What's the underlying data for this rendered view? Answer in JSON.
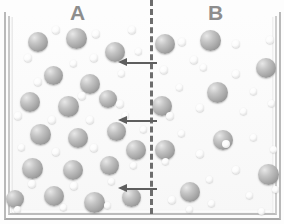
{
  "figure": {
    "title_visible": false,
    "compartments": [
      {
        "id": "A",
        "label": "A",
        "x": 70,
        "y": 2,
        "description": "concentrated solution side"
      },
      {
        "id": "B",
        "label": "B",
        "x": 208,
        "y": 2,
        "description": "dilute solution side"
      }
    ],
    "membrane": {
      "name": "semipermeable-membrane",
      "style": "dashed",
      "x": 150,
      "top": 0,
      "height": 214,
      "color": "#6d6d6d",
      "thickness": 3
    },
    "container": {
      "name": "container",
      "left": 4,
      "top": 12,
      "width": 277,
      "height": 208,
      "border_color": "#b9b9b9",
      "fill_color": "#fdfdfd"
    },
    "arrows": [
      {
        "name": "flow-arrow-top",
        "x": 118,
        "y": 58,
        "length": 39,
        "direction": "left"
      },
      {
        "name": "flow-arrow-middle",
        "x": 118,
        "y": 116,
        "length": 39,
        "direction": "left"
      },
      {
        "name": "flow-arrow-bottom",
        "x": 118,
        "y": 184,
        "length": 39,
        "direction": "left"
      }
    ],
    "colors": {
      "solute_sphere": "#a7a7a7",
      "solvent_dot": "#f4f4f4",
      "arrow": "#5e5e5e",
      "membrane": "#6d6d6d",
      "label_text": "#8d8d8d"
    },
    "legend_text": "",
    "particles": {
      "large_spheres_side_a": [
        {
          "x": 28,
          "y": 32,
          "d": 20
        },
        {
          "x": 66,
          "y": 28,
          "d": 21
        },
        {
          "x": 105,
          "y": 42,
          "d": 20
        },
        {
          "x": 44,
          "y": 66,
          "d": 19
        },
        {
          "x": 80,
          "y": 74,
          "d": 20
        },
        {
          "x": 20,
          "y": 92,
          "d": 20
        },
        {
          "x": 58,
          "y": 96,
          "d": 21
        },
        {
          "x": 99,
          "y": 90,
          "d": 18
        },
        {
          "x": 30,
          "y": 124,
          "d": 21
        },
        {
          "x": 68,
          "y": 128,
          "d": 20
        },
        {
          "x": 107,
          "y": 122,
          "d": 19
        },
        {
          "x": 126,
          "y": 140,
          "d": 20
        },
        {
          "x": 22,
          "y": 158,
          "d": 21
        },
        {
          "x": 63,
          "y": 160,
          "d": 20
        },
        {
          "x": 100,
          "y": 156,
          "d": 19
        },
        {
          "x": 44,
          "y": 186,
          "d": 20
        },
        {
          "x": 84,
          "y": 192,
          "d": 21
        },
        {
          "x": 122,
          "y": 188,
          "d": 19
        },
        {
          "x": 6,
          "y": 190,
          "d": 18
        }
      ],
      "large_spheres_side_b": [
        {
          "x": 155,
          "y": 34,
          "d": 20
        },
        {
          "x": 200,
          "y": 30,
          "d": 21
        },
        {
          "x": 256,
          "y": 58,
          "d": 20
        },
        {
          "x": 207,
          "y": 82,
          "d": 21
        },
        {
          "x": 152,
          "y": 96,
          "d": 20
        },
        {
          "x": 213,
          "y": 130,
          "d": 20
        },
        {
          "x": 155,
          "y": 140,
          "d": 20
        },
        {
          "x": 258,
          "y": 164,
          "d": 21
        },
        {
          "x": 180,
          "y": 182,
          "d": 20
        }
      ],
      "small_dots_side_a": [
        {
          "x": 52,
          "y": 26,
          "d": 8
        },
        {
          "x": 92,
          "y": 30,
          "d": 8
        },
        {
          "x": 128,
          "y": 26,
          "d": 8
        },
        {
          "x": 24,
          "y": 54,
          "d": 8
        },
        {
          "x": 90,
          "y": 54,
          "d": 8
        },
        {
          "x": 135,
          "y": 48,
          "d": 7
        },
        {
          "x": 34,
          "y": 78,
          "d": 8
        },
        {
          "x": 70,
          "y": 60,
          "d": 7
        },
        {
          "x": 118,
          "y": 70,
          "d": 7
        },
        {
          "x": 78,
          "y": 92,
          "d": 8
        },
        {
          "x": 116,
          "y": 100,
          "d": 8
        },
        {
          "x": 14,
          "y": 112,
          "d": 8
        },
        {
          "x": 48,
          "y": 116,
          "d": 8
        },
        {
          "x": 86,
          "y": 116,
          "d": 8
        },
        {
          "x": 122,
          "y": 112,
          "d": 7
        },
        {
          "x": 140,
          "y": 126,
          "d": 7
        },
        {
          "x": 52,
          "y": 148,
          "d": 8
        },
        {
          "x": 90,
          "y": 144,
          "d": 8
        },
        {
          "x": 130,
          "y": 162,
          "d": 7
        },
        {
          "x": 18,
          "y": 144,
          "d": 7
        },
        {
          "x": 28,
          "y": 180,
          "d": 8
        },
        {
          "x": 70,
          "y": 182,
          "d": 8
        },
        {
          "x": 108,
          "y": 178,
          "d": 7
        },
        {
          "x": 14,
          "y": 206,
          "d": 7
        },
        {
          "x": 60,
          "y": 204,
          "d": 7
        },
        {
          "x": 104,
          "y": 202,
          "d": 7
        }
      ],
      "small_dots_side_b": [
        {
          "x": 178,
          "y": 38,
          "d": 8
        },
        {
          "x": 232,
          "y": 40,
          "d": 8
        },
        {
          "x": 266,
          "y": 36,
          "d": 8
        },
        {
          "x": 190,
          "y": 56,
          "d": 8
        },
        {
          "x": 160,
          "y": 66,
          "d": 8
        },
        {
          "x": 232,
          "y": 70,
          "d": 8
        },
        {
          "x": 200,
          "y": 64,
          "d": 7
        },
        {
          "x": 176,
          "y": 84,
          "d": 7
        },
        {
          "x": 250,
          "y": 88,
          "d": 7
        },
        {
          "x": 166,
          "y": 112,
          "d": 8
        },
        {
          "x": 196,
          "y": 104,
          "d": 8
        },
        {
          "x": 240,
          "y": 108,
          "d": 7
        },
        {
          "x": 268,
          "y": 100,
          "d": 7
        },
        {
          "x": 178,
          "y": 130,
          "d": 7
        },
        {
          "x": 222,
          "y": 140,
          "d": 8
        },
        {
          "x": 250,
          "y": 134,
          "d": 7
        },
        {
          "x": 196,
          "y": 150,
          "d": 8
        },
        {
          "x": 162,
          "y": 158,
          "d": 7
        },
        {
          "x": 232,
          "y": 166,
          "d": 8
        },
        {
          "x": 270,
          "y": 146,
          "d": 7
        },
        {
          "x": 206,
          "y": 176,
          "d": 7
        },
        {
          "x": 168,
          "y": 196,
          "d": 8
        },
        {
          "x": 208,
          "y": 200,
          "d": 7
        },
        {
          "x": 246,
          "y": 192,
          "d": 7
        },
        {
          "x": 272,
          "y": 186,
          "d": 7
        },
        {
          "x": 186,
          "y": 206,
          "d": 7
        },
        {
          "x": 258,
          "y": 208,
          "d": 7
        }
      ]
    }
  }
}
